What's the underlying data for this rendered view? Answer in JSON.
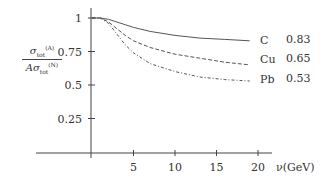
{
  "chart_data": {
    "type": "line",
    "title": "",
    "xlabel": "ν(GeV)",
    "ylabel": "σ_tot^(A) / A σ_tot^(N)",
    "xlim": [
      0,
      21
    ],
    "ylim": [
      0,
      1.1
    ],
    "x_ticks": [
      5,
      10,
      15,
      20
    ],
    "x_tick_labels": [
      "5",
      "10",
      "15",
      "20"
    ],
    "y_ticks": [
      0.25,
      0.5,
      0.75,
      1
    ],
    "y_tick_labels": [
      "0.25",
      "0.5",
      "0.75",
      "1"
    ],
    "grid": false,
    "legend": "inline labels at right end of curves",
    "series": [
      {
        "name": "C",
        "style": "solid",
        "asymptote_label": "0.83",
        "x": [
          0,
          1,
          2,
          3,
          4,
          5,
          7,
          10,
          13,
          16,
          19
        ],
        "y": [
          1.0,
          1.0,
          0.99,
          0.97,
          0.95,
          0.93,
          0.9,
          0.87,
          0.85,
          0.84,
          0.83
        ]
      },
      {
        "name": "Cu",
        "style": "dashed",
        "asymptote_label": "0.65",
        "x": [
          0,
          1,
          2,
          3,
          4,
          5,
          7,
          10,
          13,
          16,
          19
        ],
        "y": [
          1.0,
          1.0,
          0.97,
          0.92,
          0.87,
          0.83,
          0.78,
          0.73,
          0.7,
          0.67,
          0.65
        ]
      },
      {
        "name": "Pb",
        "style": "dash-dot",
        "asymptote_label": "0.53",
        "x": [
          0,
          1,
          2,
          3,
          4,
          5,
          7,
          10,
          13,
          16,
          19
        ],
        "y": [
          1.0,
          1.0,
          0.96,
          0.88,
          0.8,
          0.74,
          0.66,
          0.6,
          0.56,
          0.54,
          0.53
        ]
      }
    ]
  },
  "labels": {
    "y_fraction_num": "σ",
    "y_fraction_num_sub": "tot",
    "y_fraction_num_sup": "(A)",
    "y_fraction_den": "Aσ",
    "y_fraction_den_sub": "tot",
    "y_fraction_den_sup": "(N)"
  }
}
